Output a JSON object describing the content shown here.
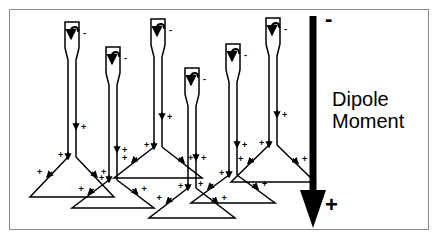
{
  "figure": {
    "background_color": "#ffffff",
    "frame_color": "#8a8a8a",
    "ink_color": "#000000"
  },
  "dipole_arrow": {
    "label_line_1": "Dipole",
    "label_line_2": "Moment",
    "top_sign": "-",
    "bottom_sign": "+",
    "direction": "downward",
    "shaft_x": 313,
    "shaft_top_y": 16,
    "shaft_bottom_y": 190,
    "shaft_width": 7,
    "head_width": 26,
    "head_bottom_y": 228
  },
  "molecules": [
    {
      "id": "molecule-1",
      "stem_x": 72,
      "head_top_y": 22,
      "stem_bottom_y": 157,
      "base_y": 197,
      "base_half_width": 42,
      "head_charge": "-",
      "base_charges": [
        "+",
        "+",
        "+"
      ]
    },
    {
      "id": "molecule-2",
      "stem_x": 113,
      "head_top_y": 47,
      "stem_bottom_y": 180,
      "base_y": 208,
      "base_half_width": 41,
      "head_charge": "-",
      "base_charges": [
        "+",
        "+",
        "+"
      ]
    },
    {
      "id": "molecule-3",
      "stem_x": 158,
      "head_top_y": 19,
      "stem_bottom_y": 147,
      "base_y": 178,
      "base_half_width": 44,
      "head_charge": "-",
      "base_charges": [
        "+",
        "+",
        "+"
      ]
    },
    {
      "id": "molecule-4",
      "stem_x": 192,
      "head_top_y": 68,
      "stem_bottom_y": 188,
      "base_y": 218,
      "base_half_width": 43,
      "head_charge": "-",
      "base_charges": [
        "+",
        "+",
        "+"
      ]
    },
    {
      "id": "molecule-5",
      "stem_x": 233,
      "head_top_y": 44,
      "stem_bottom_y": 175,
      "base_y": 203,
      "base_half_width": 42,
      "head_charge": "-",
      "base_charges": [
        "+",
        "+",
        "+"
      ]
    },
    {
      "id": "molecule-6",
      "stem_x": 273,
      "head_top_y": 18,
      "stem_bottom_y": 145,
      "base_y": 182,
      "base_half_width": 42,
      "head_charge": "-",
      "base_charges": [
        "+",
        "+",
        "+"
      ]
    }
  ]
}
